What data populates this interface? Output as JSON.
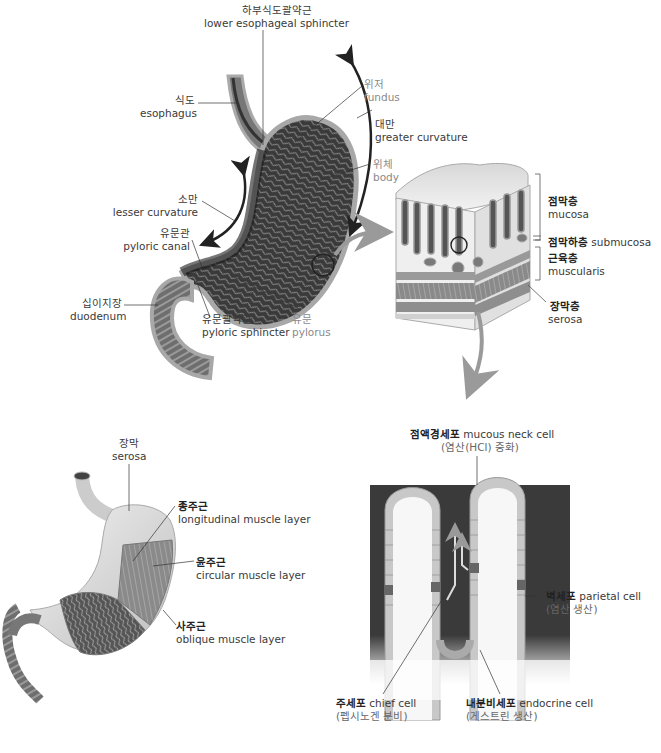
{
  "diagram": {
    "panels": {
      "stomach_anatomy": {
        "labels": [
          {
            "ko": "하부식도괄약근",
            "en": "lower esophageal sphincter"
          },
          {
            "ko": "식도",
            "en": "esophagus"
          },
          {
            "ko": "위저",
            "en": "fundus"
          },
          {
            "ko": "대만",
            "en": "greater curvature"
          },
          {
            "ko": "위체",
            "en": "body"
          },
          {
            "ko": "소만",
            "en": "lesser curvature"
          },
          {
            "ko": "유문관",
            "en": "pyloric canal"
          },
          {
            "ko": "십이지장",
            "en": "duodenum"
          },
          {
            "ko": "유문괄약근",
            "en": "pyloric sphincter"
          },
          {
            "ko": "유문",
            "en": "pylorus"
          }
        ]
      },
      "wall_layers": {
        "labels": [
          {
            "ko": "점막층",
            "en": "mucosa"
          },
          {
            "ko": "점막하층",
            "en": "submucosa"
          },
          {
            "ko": "근육층",
            "en": "muscularis"
          },
          {
            "ko": "장막층",
            "en": "serosa"
          }
        ]
      },
      "muscle_layers": {
        "labels": [
          {
            "ko": "장막",
            "en": "serosa"
          },
          {
            "ko": "종주근",
            "en": "longitudinal muscle layer"
          },
          {
            "ko": "윤주근",
            "en": "circular muscle layer"
          },
          {
            "ko": "사주근",
            "en": "oblique muscle layer"
          }
        ]
      },
      "gastric_gland": {
        "labels": [
          {
            "ko": "점액경세포",
            "en": "mucous neck cell",
            "note": "(염산(HCl) 중화)"
          },
          {
            "ko": "벽세포",
            "en": "parietal cell",
            "note": "(염산 생산)"
          },
          {
            "ko": "주세포",
            "en": "chief cell",
            "note": "(펩시노겐 분비)"
          },
          {
            "ko": "내분비세포",
            "en": "endocrine cell",
            "note": "(게스트린 생산)"
          }
        ]
      }
    },
    "colors": {
      "dark_tissue": "#2a2a2a",
      "mid_tissue": "#8c8c8c",
      "light_tissue": "#d9d9d9",
      "arrow_gray": "#9a9a9a",
      "label_gray": "#8a8a8a"
    }
  }
}
